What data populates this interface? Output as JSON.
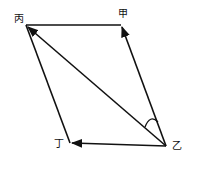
{
  "diagram": {
    "type": "vector-parallelogram",
    "labels": {
      "bing": "丙",
      "jia": "甲",
      "yi": "乙",
      "ding": "丁"
    },
    "points": {
      "bing": [
        26,
        25
      ],
      "jia": [
        121,
        25
      ],
      "yi": [
        166,
        146
      ],
      "ding": [
        70,
        143
      ]
    },
    "edges": [
      {
        "from": "yi",
        "to": "jia",
        "arrow": true
      },
      {
        "from": "yi",
        "to": "bing",
        "arrow": true
      },
      {
        "from": "yi",
        "to": "ding",
        "arrow": true
      },
      {
        "from": "bing",
        "to": "jia",
        "arrow": false
      },
      {
        "from": "bing",
        "to": "ding",
        "arrow": false
      }
    ],
    "angle_mark": {
      "at": "yi",
      "between": [
        "jia",
        "bing"
      ]
    },
    "stroke_color": "#111111"
  }
}
